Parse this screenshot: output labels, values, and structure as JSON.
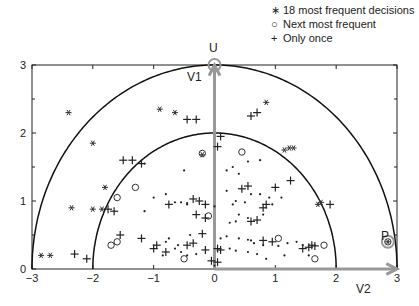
{
  "chart_data": {
    "type": "scatter",
    "title": "",
    "xlabel": "",
    "ylabel": "",
    "xlim": [
      -3,
      3
    ],
    "ylim": [
      0,
      3
    ],
    "x_ticks": [
      "-3",
      "-2",
      "-1",
      "0",
      "1",
      "2",
      "3"
    ],
    "y_ticks": [
      "0",
      "1",
      "2",
      "3"
    ],
    "grid": false,
    "legend_position": "top-right",
    "legend": [
      {
        "marker": "*",
        "label": "18 most frequent decisions"
      },
      {
        "marker": "o",
        "label": "Next most frequent"
      },
      {
        "marker": "+",
        "label": "Only once"
      }
    ],
    "circles": [
      {
        "name": "inner-semicircle",
        "radius": 2
      },
      {
        "name": "outer-semicircle",
        "radius": 3
      }
    ],
    "vectors": [
      {
        "name": "V1",
        "from": [
          0,
          0
        ],
        "to": [
          0,
          3
        ],
        "color": "#999999"
      },
      {
        "name": "V2",
        "from": [
          0,
          0
        ],
        "to": [
          3,
          0
        ],
        "color": "#999999"
      }
    ],
    "annotations": [
      {
        "text": "U",
        "x": 0,
        "y": 3.25
      },
      {
        "text": "V1",
        "x": -0.3,
        "y": 2.8
      },
      {
        "text": "V2",
        "x": 2.5,
        "y": -0.28
      },
      {
        "text": "P",
        "x": 2.7,
        "y": 0.5
      }
    ],
    "highlighted_points": [
      {
        "label": "U",
        "x": 0,
        "y": 3
      },
      {
        "label": "P",
        "x": 2.85,
        "y": 0.4
      }
    ],
    "series": [
      {
        "name": "18 most frequent decisions",
        "marker": "*",
        "points": [
          [
            -2.4,
            2.3
          ],
          [
            -2.0,
            1.85
          ],
          [
            -1.8,
            1.2
          ],
          [
            -2.35,
            0.9
          ],
          [
            -2.0,
            0.88
          ],
          [
            -1.85,
            0.88
          ],
          [
            -2.85,
            0.2
          ],
          [
            -2.7,
            0.2
          ],
          [
            -0.9,
            2.35
          ],
          [
            -0.65,
            2.3
          ],
          [
            0.85,
            2.45
          ],
          [
            1.15,
            1.75
          ],
          [
            1.23,
            1.78
          ],
          [
            1.3,
            1.78
          ],
          [
            1.7,
            0.95
          ],
          [
            1.75,
            0.98
          ],
          [
            -0.2,
            1.68
          ],
          [
            2.85,
            0.4
          ]
        ]
      },
      {
        "name": "Next most frequent",
        "marker": "o",
        "points": [
          [
            -1.3,
            1.2
          ],
          [
            -1.6,
            1.05
          ],
          [
            -1.7,
            0.35
          ],
          [
            -1.6,
            0.4
          ],
          [
            -0.5,
            0.15
          ],
          [
            -0.2,
            1.7
          ],
          [
            0.45,
            1.72
          ],
          [
            -0.1,
            0.78
          ],
          [
            1.05,
            0.45
          ],
          [
            1.8,
            0.35
          ],
          [
            1.65,
            0.15
          ],
          [
            2.85,
            0.4
          ]
        ]
      },
      {
        "name": "Only once",
        "marker": "+",
        "points": [
          [
            -2.3,
            0.22
          ],
          [
            -2.1,
            0.15
          ],
          [
            -1.75,
            0.88
          ],
          [
            -1.65,
            0.85
          ],
          [
            -1.5,
            1.6
          ],
          [
            -1.35,
            1.6
          ],
          [
            -1.2,
            1.55
          ],
          [
            -0.45,
            2.2
          ],
          [
            -0.3,
            2.2
          ],
          [
            0.6,
            2.25
          ],
          [
            0.7,
            2.3
          ],
          [
            -0.75,
            0.95
          ],
          [
            -0.35,
            1.03
          ],
          [
            -0.25,
            1.0
          ],
          [
            -0.15,
            0.95
          ],
          [
            -0.3,
            0.8
          ],
          [
            -0.15,
            0.75
          ],
          [
            0.05,
            1.8
          ],
          [
            0.1,
            1.95
          ],
          [
            0.45,
            1.18
          ],
          [
            0.55,
            1.22
          ],
          [
            0.85,
            0.95
          ],
          [
            0.8,
            0.9
          ],
          [
            0.6,
            0.7
          ],
          [
            0.7,
            0.72
          ],
          [
            1.0,
            1.2
          ],
          [
            1.25,
            1.3
          ],
          [
            1.9,
            0.95
          ],
          [
            -1.55,
            0.5
          ],
          [
            -1.2,
            0.45
          ],
          [
            -1.0,
            0.3
          ],
          [
            -0.95,
            0.35
          ],
          [
            -0.8,
            0.25
          ],
          [
            -0.45,
            0.35
          ],
          [
            -0.35,
            0.38
          ],
          [
            -0.2,
            0.52
          ],
          [
            -0.15,
            0.28
          ],
          [
            0.05,
            0.3
          ],
          [
            0.1,
            0.28
          ],
          [
            0.8,
            0.42
          ],
          [
            0.95,
            0.4
          ],
          [
            1.45,
            0.3
          ],
          [
            1.55,
            0.32
          ],
          [
            1.6,
            0.35
          ],
          [
            1.65,
            0.34
          ],
          [
            -0.05,
            0.12
          ],
          [
            0.05,
            0.1
          ]
        ]
      },
      {
        "name": "other decisions",
        "marker": ".",
        "points": [
          [
            -1.15,
            1.55
          ],
          [
            -0.5,
            1.45
          ],
          [
            -1.0,
            1.05
          ],
          [
            -1.15,
            0.85
          ],
          [
            -0.8,
            1.1
          ],
          [
            -0.45,
            0.95
          ],
          [
            -0.65,
            0.98
          ],
          [
            -0.55,
            0.98
          ],
          [
            -0.45,
            0.97
          ],
          [
            0.0,
            0.92
          ],
          [
            0.2,
            1.15
          ],
          [
            0.35,
            1.0
          ],
          [
            0.4,
            0.8
          ],
          [
            0.6,
            1.1
          ],
          [
            0.75,
            1.1
          ],
          [
            0.9,
            1.05
          ],
          [
            1.1,
            1.05
          ],
          [
            0.95,
            0.95
          ],
          [
            0.3,
            0.95
          ],
          [
            0.5,
            0.98
          ],
          [
            0.55,
            0.75
          ],
          [
            0.25,
            0.68
          ],
          [
            0.35,
            0.7
          ],
          [
            0.8,
            0.8
          ],
          [
            0.2,
            1.45
          ],
          [
            0.3,
            1.5
          ],
          [
            0.55,
            1.58
          ],
          [
            0.75,
            1.6
          ],
          [
            0.4,
            1.4
          ],
          [
            -0.75,
            0.45
          ],
          [
            -0.6,
            0.35
          ],
          [
            -0.8,
            0.4
          ],
          [
            -0.55,
            0.25
          ],
          [
            -0.65,
            0.3
          ],
          [
            -0.45,
            0.2
          ],
          [
            -0.3,
            0.22
          ],
          [
            0.1,
            0.45
          ],
          [
            0.2,
            0.48
          ],
          [
            0.4,
            0.45
          ],
          [
            0.55,
            0.43
          ],
          [
            0.6,
            0.42
          ],
          [
            0.65,
            0.38
          ],
          [
            0.8,
            0.35
          ],
          [
            1.05,
            0.34
          ],
          [
            1.2,
            0.38
          ],
          [
            0.25,
            0.3
          ],
          [
            0.35,
            0.27
          ],
          [
            0.55,
            0.25
          ],
          [
            0.7,
            0.22
          ],
          [
            0.85,
            0.15
          ],
          [
            1.15,
            0.2
          ],
          [
            -0.4,
            0.5
          ],
          [
            -0.85,
            0.2
          ],
          [
            0.0,
            0.05
          ],
          [
            1.35,
            0.4
          ],
          [
            1.45,
            0.35
          ],
          [
            1.55,
            0.2
          ]
        ]
      }
    ]
  }
}
